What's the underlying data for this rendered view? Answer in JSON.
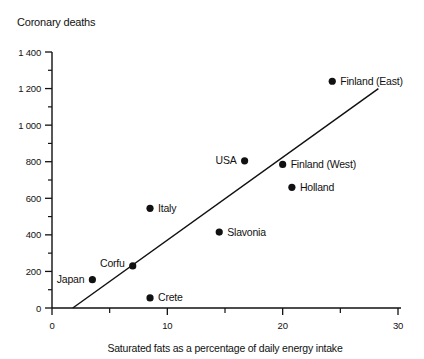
{
  "chart_data": {
    "type": "scatter",
    "title": "Coronary deaths",
    "xlabel": "Saturated fats as a percentage of daily energy intake",
    "ylabel": "Coronary deaths",
    "xlim": [
      0,
      30
    ],
    "ylim": [
      0,
      1400
    ],
    "grid": false,
    "legend": null,
    "x_major_ticks": [
      {
        "value": 0,
        "label": "0"
      },
      {
        "value": 10,
        "label": "10"
      },
      {
        "value": 20,
        "label": "20"
      },
      {
        "value": 30,
        "label": "30"
      }
    ],
    "x_minor_ticks": [
      5,
      15,
      25
    ],
    "y_major_ticks": [
      {
        "value": 0,
        "label": "0"
      },
      {
        "value": 200,
        "label": "200"
      },
      {
        "value": 400,
        "label": "400"
      },
      {
        "value": 600,
        "label": "600"
      },
      {
        "value": 800,
        "label": "800"
      },
      {
        "value": 1000,
        "label": "1 000"
      },
      {
        "value": 1200,
        "label": "1 200"
      },
      {
        "value": 1400,
        "label": "1 400"
      }
    ],
    "y_minor_ticks": [
      100,
      300,
      500,
      700,
      900,
      1100,
      1300
    ],
    "points": [
      {
        "label": "Japan",
        "x": 3.5,
        "y": 155,
        "label_side": "left"
      },
      {
        "label": "Corfu",
        "x": 7,
        "y": 230,
        "label_side": "left",
        "label_dy": -2.5
      },
      {
        "label": "Crete",
        "x": 8.5,
        "y": 55,
        "label_side": "right"
      },
      {
        "label": "Italy",
        "x": 8.5,
        "y": 545,
        "label_side": "right"
      },
      {
        "label": "Slavonia",
        "x": 14.5,
        "y": 415,
        "label_side": "right"
      },
      {
        "label": "USA",
        "x": 16.7,
        "y": 805,
        "label_side": "left"
      },
      {
        "label": "Finland (West)",
        "x": 20,
        "y": 785,
        "label_side": "right"
      },
      {
        "label": "Holland",
        "x": 20.8,
        "y": 660,
        "label_side": "right"
      },
      {
        "label": "Finland (East)",
        "x": 24.3,
        "y": 1240,
        "label_side": "right"
      }
    ],
    "trend_line": {
      "x1": 1.8,
      "y1": 0,
      "x2": 28.3,
      "y2": 1200
    },
    "colors": {
      "ink": "#111111",
      "background": "#ffffff"
    }
  }
}
